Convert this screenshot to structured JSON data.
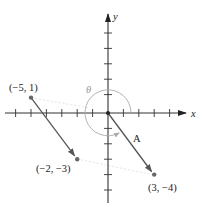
{
  "diagram": {
    "axes": {
      "x_label": "x",
      "y_label": "y",
      "x_ticks": [
        -6,
        -5,
        -4,
        -3,
        -2,
        -1,
        1,
        2,
        3,
        4
      ],
      "y_ticks": [
        5,
        4,
        3,
        2,
        1,
        -1,
        -2,
        -3,
        -4,
        -5
      ],
      "axis_color": "#333333"
    },
    "points": [
      {
        "label": "(−5, 1)",
        "x": -5,
        "y": 1
      },
      {
        "label": "(−2, −3)",
        "x": -2,
        "y": -3
      },
      {
        "label": "(3, −4)",
        "x": 3,
        "y": -4
      }
    ],
    "vectors": [
      {
        "from": [
          -5,
          1
        ],
        "to": [
          -2,
          -3
        ],
        "label": ""
      },
      {
        "from": [
          0,
          0
        ],
        "to": [
          3,
          -4
        ],
        "label": "A"
      }
    ],
    "angle": {
      "label": "θ",
      "radius_units": 1.5,
      "color": "#999999"
    },
    "vector_color": "#555555",
    "guide_color": "#d8d8d8"
  }
}
